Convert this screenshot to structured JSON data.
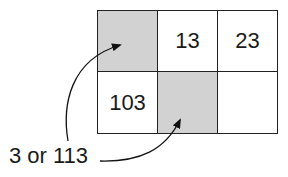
{
  "grid": {
    "rows": [
      [
        {
          "value": "",
          "shaded": true
        },
        {
          "value": "13",
          "shaded": false
        },
        {
          "value": "23",
          "shaded": false
        }
      ],
      [
        {
          "value": "103",
          "shaded": false
        },
        {
          "value": "",
          "shaded": true
        },
        {
          "value": "",
          "shaded": false
        }
      ]
    ]
  },
  "annotation": {
    "label": "3 or 113"
  },
  "colors": {
    "shaded": "#d2d2d2",
    "line": "#222222"
  }
}
